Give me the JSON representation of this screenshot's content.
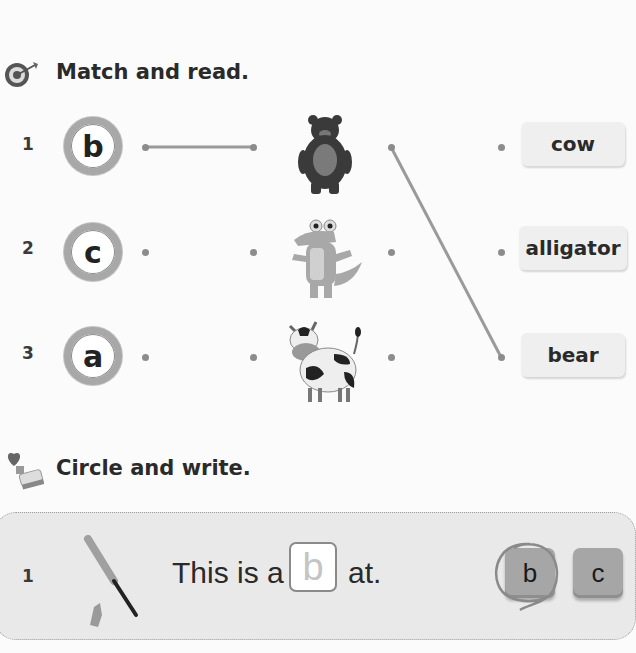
{
  "section1": {
    "icon": "target-icon",
    "title": "Match and read.",
    "rows": [
      {
        "number": "1",
        "letter": "b",
        "animal": "bear",
        "word": "cow"
      },
      {
        "number": "2",
        "letter": "c",
        "animal": "alligator",
        "word": "alligator"
      },
      {
        "number": "3",
        "letter": "a",
        "animal": "cow",
        "word": "bear"
      }
    ],
    "drawn_lines": [
      {
        "from": "letter-b",
        "to": "bear-picture"
      },
      {
        "from": "bear-picture",
        "to": "word-bear"
      }
    ]
  },
  "section2": {
    "icon": "stamp-heart-icon",
    "title": "Circle and write.",
    "items": [
      {
        "number": "1",
        "picture": "baseball-bat",
        "sentence_before": "This is a",
        "answer": "b",
        "sentence_after": "at.",
        "choices": [
          "b",
          "c"
        ],
        "circled_choice": "b"
      }
    ]
  },
  "colors": {
    "background": "#fbfbfb",
    "text": "#2a2a2a",
    "line": "#9a9a9a",
    "panel": "#e9e9e9"
  }
}
